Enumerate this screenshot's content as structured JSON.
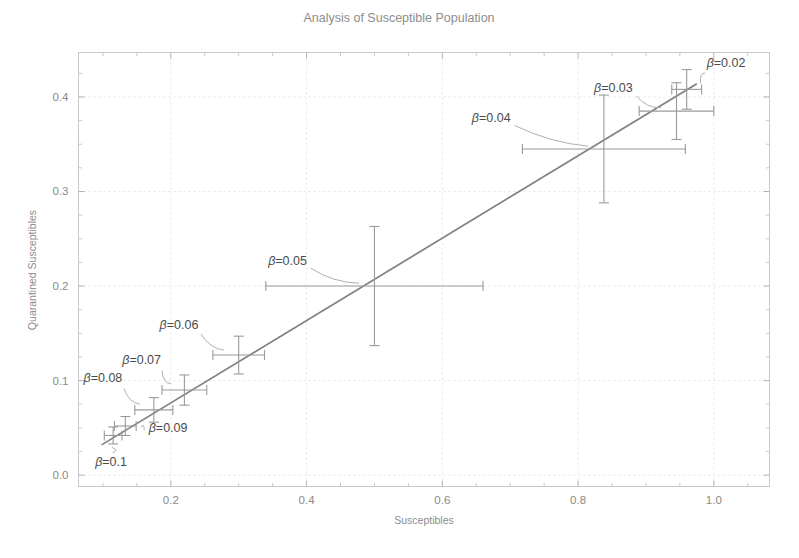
{
  "chart_data": {
    "type": "scatter",
    "title": "Analysis of Susceptible Population",
    "xlabel": "Susceptibles",
    "ylabel": "Quarantined Susceptibles",
    "xlim": [
      0.064,
      1.082
    ],
    "ylim": [
      -0.012,
      0.447
    ],
    "grid": true,
    "legend": "none",
    "xticks": [
      "0.2",
      "0.4",
      "0.6",
      "0.8",
      "1.0"
    ],
    "xtick_values": [
      0.2,
      0.4,
      0.6,
      0.8,
      1.0
    ],
    "yticks": [
      "0.0",
      "0.1",
      "0.2",
      "0.3",
      "0.4"
    ],
    "ytick_values": [
      0.0,
      0.1,
      0.2,
      0.3,
      0.4
    ],
    "series": [
      {
        "name": "Quarantined vs Susceptibles",
        "points": [
          {
            "label": "β=0.02",
            "x": 0.96,
            "y": 0.408,
            "xerr": 0.022,
            "yerr": 0.021,
            "label_x": 1.018,
            "label_y": 0.432
          },
          {
            "label": "β=0.03",
            "x": 0.945,
            "y": 0.385,
            "xerr": 0.055,
            "yerr": 0.03,
            "label_x": 0.852,
            "label_y": 0.405
          },
          {
            "label": "β=0.04",
            "x": 0.838,
            "y": 0.345,
            "xerr": 0.12,
            "yerr": 0.057,
            "label_x": 0.672,
            "label_y": 0.373
          },
          {
            "label": "β=0.05",
            "x": 0.5,
            "y": 0.2,
            "xerr": 0.16,
            "yerr": 0.063,
            "label_x": 0.372,
            "label_y": 0.222
          },
          {
            "label": "β=0.06",
            "x": 0.3,
            "y": 0.127,
            "xerr": 0.038,
            "yerr": 0.02,
            "label_x": 0.212,
            "label_y": 0.155
          },
          {
            "label": "β=0.07",
            "x": 0.22,
            "y": 0.09,
            "xerr": 0.033,
            "yerr": 0.016,
            "label_x": 0.157,
            "label_y": 0.118
          },
          {
            "label": "β=0.08",
            "x": 0.175,
            "y": 0.069,
            "xerr": 0.028,
            "yerr": 0.013,
            "label_x": 0.1,
            "label_y": 0.098
          },
          {
            "label": "β=0.09",
            "x": 0.133,
            "y": 0.052,
            "xerr": 0.016,
            "yerr": 0.01,
            "label_x": 0.196,
            "label_y": 0.046
          },
          {
            "label": "β=0.1",
            "x": 0.115,
            "y": 0.042,
            "xerr": 0.013,
            "yerr": 0.009,
            "label_x": 0.112,
            "label_y": 0.01
          }
        ],
        "fit_line": {
          "x_start": 0.098,
          "y_start": 0.032,
          "x_end": 0.975,
          "y_end": 0.414
        }
      }
    ]
  }
}
